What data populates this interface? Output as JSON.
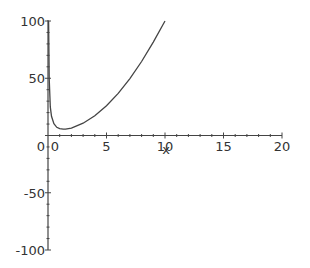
{
  "chart_data": {
    "type": "line",
    "title": "",
    "xlabel": "x",
    "ylabel": "",
    "xlim": [
      0,
      20
    ],
    "ylim": [
      -100,
      100
    ],
    "grid": false,
    "legend": null,
    "x_ticks": [
      0,
      5,
      10,
      15,
      20
    ],
    "x_tick_labels": [
      "0",
      "5",
      "10",
      "15",
      "20"
    ],
    "y_ticks": [
      100,
      50,
      0,
      -50,
      -100
    ],
    "y_tick_labels": [
      "100",
      "50",
      "0",
      "-50",
      "-100"
    ],
    "series": [
      {
        "name": "f(x)",
        "color": "#444444",
        "x": [
          0.05,
          0.1,
          0.2,
          0.3,
          0.5,
          0.75,
          1.0,
          1.3,
          1.5,
          2,
          3,
          4,
          5,
          6,
          7,
          8,
          9,
          10
        ],
        "y": [
          100,
          50,
          25,
          16.8,
          10.3,
          7.2,
          6,
          5.5,
          5.6,
          6.5,
          10.7,
          17.3,
          26,
          36.8,
          49.7,
          64.6,
          81.6,
          100
        ]
      }
    ]
  }
}
